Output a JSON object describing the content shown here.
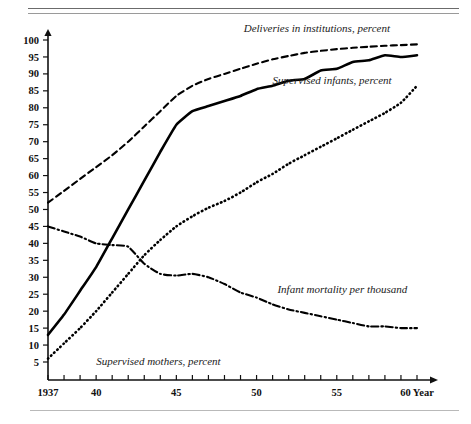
{
  "chart_data": {
    "type": "line",
    "title": "",
    "xlabel": "Year",
    "ylabel": "",
    "xlim": [
      1937,
      1960
    ],
    "ylim": [
      0,
      100
    ],
    "grid": false,
    "legend": "inline-annotations",
    "x_ticks_major": [
      "1937",
      "40",
      "45",
      "50",
      "55",
      "60"
    ],
    "x_tick_values_major": [
      1937,
      1940,
      1945,
      1950,
      1955,
      1960
    ],
    "x_tick_minor_step": 1,
    "y_ticks": [
      "5",
      "10",
      "15",
      "20",
      "25",
      "30",
      "35",
      "40",
      "45",
      "50",
      "55",
      "60",
      "65",
      "70",
      "75",
      "80",
      "85",
      "90",
      "95",
      "100"
    ],
    "y_tick_values": [
      5,
      10,
      15,
      20,
      25,
      30,
      35,
      40,
      45,
      50,
      55,
      60,
      65,
      70,
      75,
      80,
      85,
      90,
      95,
      100
    ],
    "x": [
      1937,
      1938,
      1939,
      1940,
      1941,
      1942,
      1943,
      1944,
      1945,
      1946,
      1947,
      1948,
      1949,
      1950,
      1951,
      1952,
      1953,
      1954,
      1955,
      1956,
      1957,
      1958,
      1959,
      1960
    ],
    "series": [
      {
        "name": "Deliveries in institutions, percent",
        "style": "dashed",
        "label_x": 1949.2,
        "label_y": 102.5,
        "values": [
          52.0,
          55.5,
          59.0,
          62.5,
          66.0,
          70.0,
          74.5,
          79.0,
          83.5,
          86.5,
          88.5,
          90.0,
          91.5,
          93.0,
          94.3,
          95.3,
          96.2,
          96.8,
          97.3,
          97.7,
          98.0,
          98.3,
          98.5,
          98.7
        ]
      },
      {
        "name": "Supervised infants, percent",
        "style": "solid",
        "label_x": 1951.0,
        "label_y": 87.0,
        "values": [
          13.0,
          19.0,
          26.0,
          33.0,
          41.5,
          50.0,
          58.5,
          67.0,
          75.0,
          79.0,
          80.5,
          82.0,
          83.5,
          85.5,
          86.5,
          88.0,
          88.5,
          91.0,
          91.5,
          93.5,
          94.0,
          95.5,
          95.0,
          95.5
        ]
      },
      {
        "name": "Supervised mothers, percent",
        "style": "dotted",
        "label_x": 1940.0,
        "label_y": 4.0,
        "values": [
          6.0,
          10.5,
          15.0,
          20.0,
          25.5,
          31.0,
          36.5,
          41.0,
          45.0,
          48.0,
          50.5,
          52.5,
          55.0,
          58.0,
          60.5,
          63.5,
          66.0,
          68.5,
          71.0,
          73.5,
          76.0,
          78.5,
          81.5,
          86.5
        ]
      },
      {
        "name": "Infant mortality per thousand",
        "style": "dashdot",
        "label_x": 1951.3,
        "label_y": 25.5,
        "values": [
          45.0,
          43.5,
          42.0,
          40.0,
          39.5,
          39.0,
          34.0,
          31.0,
          30.5,
          31.0,
          30.0,
          28.0,
          25.5,
          24.0,
          22.0,
          20.5,
          19.5,
          18.5,
          17.5,
          16.5,
          15.5,
          15.5,
          15.0,
          15.0
        ]
      }
    ]
  },
  "axis": {
    "x_label_suffix": "Year"
  }
}
